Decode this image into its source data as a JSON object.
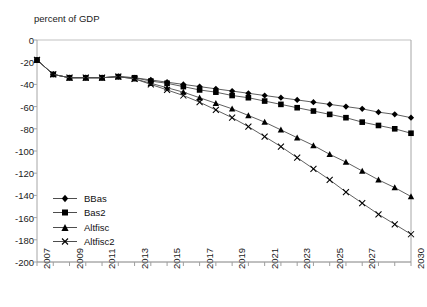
{
  "chart_data": {
    "type": "line",
    "title": "",
    "xlabel": "",
    "ylabel": "percent of GDP",
    "ylim": [
      -200,
      0
    ],
    "xlim": [
      2007,
      2030
    ],
    "ytick_labels": [
      "0",
      "-20",
      "-40",
      "-60",
      "-80",
      "-100",
      "-120",
      "-140",
      "-160",
      "-180",
      "-200"
    ],
    "ytick_values": [
      0,
      -20,
      -40,
      -60,
      -80,
      -100,
      -120,
      -140,
      -160,
      -180,
      -200
    ],
    "xtick_labels": [
      "2007",
      "2009",
      "2011",
      "2013",
      "2015",
      "2017",
      "2019",
      "2021",
      "2023",
      "2025",
      "2027",
      "2030"
    ],
    "xtick_values": [
      2007,
      2009,
      2011,
      2013,
      2015,
      2017,
      2019,
      2021,
      2023,
      2025,
      2027,
      2030
    ],
    "x": [
      2007,
      2008,
      2009,
      2010,
      2011,
      2012,
      2013,
      2014,
      2015,
      2016,
      2017,
      2018,
      2019,
      2020,
      2021,
      2022,
      2023,
      2024,
      2025,
      2026,
      2027,
      2028,
      2029,
      2030
    ],
    "grid": false,
    "legend_position": "lower-left",
    "series": [
      {
        "name": "BBas",
        "marker": "diamond",
        "color": "#000000",
        "values": [
          -18,
          -31,
          -34,
          -34,
          -34,
          -33,
          -34,
          -36,
          -38,
          -40,
          -42,
          -44,
          -46,
          -48,
          -50,
          -52,
          -54,
          -56,
          -58,
          -60,
          -62,
          -65,
          -67,
          -70
        ]
      },
      {
        "name": "Bas2",
        "marker": "square",
        "color": "#000000",
        "values": [
          -18,
          -31,
          -34,
          -34,
          -34,
          -33,
          -34,
          -37,
          -39,
          -42,
          -45,
          -47,
          -50,
          -52,
          -55,
          -58,
          -61,
          -64,
          -67,
          -70,
          -74,
          -77,
          -80,
          -84
        ]
      },
      {
        "name": "Altfisc",
        "marker": "triangle",
        "color": "#000000",
        "values": [
          -18,
          -31,
          -34,
          -34,
          -34,
          -33,
          -35,
          -39,
          -43,
          -47,
          -52,
          -57,
          -62,
          -68,
          -74,
          -81,
          -88,
          -95,
          -103,
          -110,
          -118,
          -126,
          -133,
          -141
        ]
      },
      {
        "name": "Altfisc2",
        "marker": "x",
        "color": "#000000",
        "values": [
          -18,
          -31,
          -34,
          -34,
          -34,
          -33,
          -35,
          -40,
          -45,
          -50,
          -56,
          -63,
          -70,
          -78,
          -87,
          -96,
          -106,
          -116,
          -126,
          -137,
          -147,
          -157,
          -166,
          -175
        ]
      }
    ]
  },
  "legend": {
    "items": [
      {
        "label": "BBas",
        "marker": "diamond"
      },
      {
        "label": "Bas2",
        "marker": "square"
      },
      {
        "label": "Altfisc",
        "marker": "triangle"
      },
      {
        "label": "Altfisc2",
        "marker": "x"
      }
    ]
  },
  "colors": {
    "line": "#4d4d4d",
    "marker": "#000000",
    "axis": "#a6a6a6",
    "text": "#1a1a1a"
  }
}
